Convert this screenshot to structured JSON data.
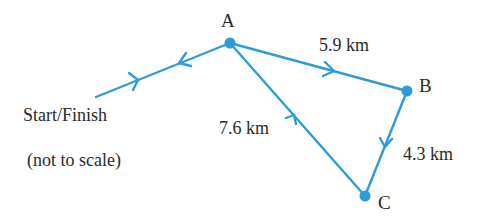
{
  "diagram": {
    "type": "route-network",
    "accent_color": "#2f9bd8",
    "text_color": "#2b2b2b",
    "points": [
      {
        "id": "A",
        "label": "A"
      },
      {
        "id": "B",
        "label": "B"
      },
      {
        "id": "C",
        "label": "C"
      }
    ],
    "start_label": "Start/Finish",
    "note": "(not to scale)",
    "edges": [
      {
        "from": "Start/Finish",
        "to": "A",
        "direction": "both ways (out and back)",
        "label": ""
      },
      {
        "from": "A",
        "to": "B",
        "label": "5.9 km"
      },
      {
        "from": "B",
        "to": "C",
        "label": "4.3 km"
      },
      {
        "from": "C",
        "to": "A",
        "label": "7.6 km"
      }
    ],
    "labels": {
      "A": "A",
      "B": "B",
      "C": "C",
      "ab": "5.9 km",
      "bc": "4.3 km",
      "ca": "7.6 km",
      "start": "Start/Finish",
      "note": "(not to scale)"
    }
  }
}
